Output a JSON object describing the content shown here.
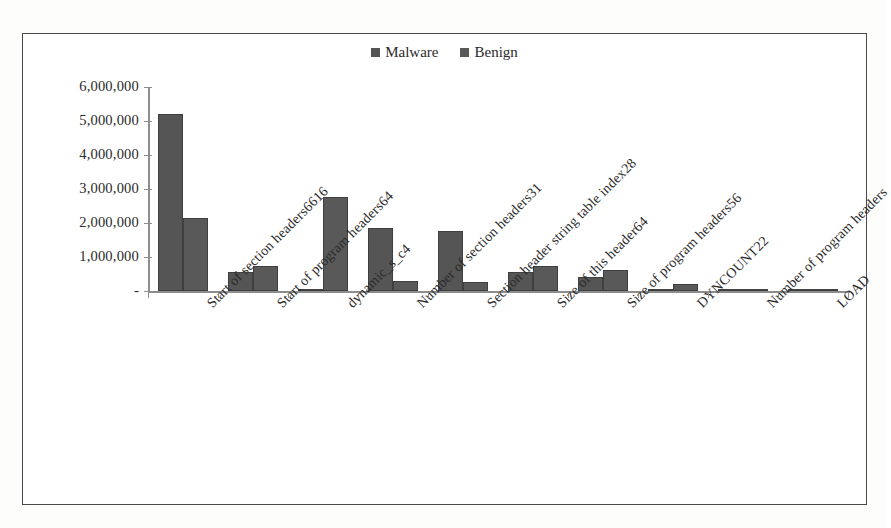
{
  "chart_data": {
    "type": "bar",
    "title": "",
    "xlabel": "",
    "ylabel": "",
    "grid": false,
    "legend_position": "top-center",
    "ylim": [
      0,
      6000000
    ],
    "ytick_labels": [
      "6,000,000",
      "5,000,000",
      "4,000,000",
      "3,000,000",
      "2,000,000",
      "1,000,000",
      "-"
    ],
    "ytick_values": [
      6000000,
      5000000,
      4000000,
      3000000,
      2000000,
      1000000,
      0
    ],
    "categories": [
      "Start of section headers6616",
      "Start of program headers64",
      "dynamic_s_c4",
      "Number of section headers31",
      "Section header string table index28",
      "Size of this header64",
      "Size of program headers56",
      "DYNCOUNT22",
      "Number of program headers",
      "LOAD"
    ],
    "series": [
      {
        "name": "Malware",
        "color": "#555555",
        "values": [
          5200000,
          550000,
          50000,
          1850000,
          1770000,
          570000,
          400000,
          15000,
          10000,
          8000
        ]
      },
      {
        "name": "Benign",
        "color": "#595959",
        "values": [
          2150000,
          730000,
          2770000,
          280000,
          270000,
          730000,
          620000,
          215000,
          60000,
          12000
        ]
      }
    ]
  },
  "legend": {
    "items": [
      {
        "label": "Malware",
        "color": "#555555"
      },
      {
        "label": "Benign",
        "color": "#595959"
      }
    ]
  }
}
